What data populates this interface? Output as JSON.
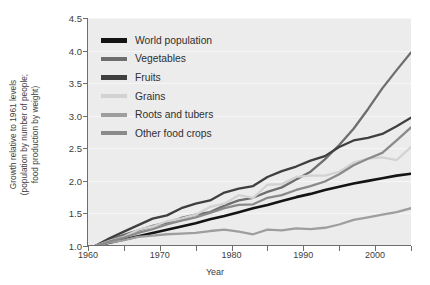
{
  "chart_data": {
    "type": "line",
    "title": "",
    "xlabel": "Year",
    "ylabel": "Growth relative to 1961 levels (population by number of people; food production by weight)",
    "ylabel_line1": "Growth relative to 1961 levels",
    "ylabel_line2": "(population by number of people;",
    "ylabel_line3": "food production by weight)",
    "xlim": [
      1960,
      2005
    ],
    "ylim": [
      1.0,
      4.5
    ],
    "grid": true,
    "legend_position": "top-left inside plot",
    "xticks": [
      1960,
      1965,
      1970,
      1975,
      1980,
      1985,
      1990,
      1995,
      2000,
      2005
    ],
    "xtick_labels": [
      "1960",
      "",
      "1970",
      "",
      "1980",
      "",
      "1990",
      "",
      "2000",
      ""
    ],
    "yticks": [
      1.0,
      1.5,
      2.0,
      2.5,
      3.0,
      3.5,
      4.0,
      4.5
    ],
    "ytick_labels": [
      "1.0",
      "1.5",
      "2.0",
      "2.5",
      "3.0",
      "3.5",
      "4.0",
      "4.5"
    ],
    "x": [
      1961,
      1963,
      1965,
      1967,
      1969,
      1971,
      1973,
      1975,
      1977,
      1979,
      1981,
      1983,
      1985,
      1987,
      1989,
      1991,
      1993,
      1995,
      1997,
      1999,
      2001,
      2003,
      2005
    ],
    "series": [
      {
        "name": "World population",
        "color": "#141414",
        "width": 2.6,
        "values": [
          1.0,
          1.05,
          1.1,
          1.15,
          1.2,
          1.25,
          1.3,
          1.35,
          1.41,
          1.46,
          1.52,
          1.58,
          1.63,
          1.69,
          1.75,
          1.8,
          1.86,
          1.91,
          1.96,
          2.0,
          2.04,
          2.08,
          2.11
        ]
      },
      {
        "name": "Vegetables",
        "color": "#6e6e6e",
        "width": 2.3,
        "values": [
          1.0,
          1.1,
          1.17,
          1.24,
          1.31,
          1.36,
          1.43,
          1.48,
          1.52,
          1.62,
          1.7,
          1.74,
          1.83,
          1.9,
          2.02,
          2.14,
          2.33,
          2.55,
          2.8,
          3.1,
          3.42,
          3.7,
          3.97
        ]
      },
      {
        "name": "Fruits",
        "color": "#3f3f3f",
        "width": 2.3,
        "values": [
          1.0,
          1.12,
          1.22,
          1.32,
          1.42,
          1.47,
          1.58,
          1.65,
          1.7,
          1.82,
          1.88,
          1.92,
          2.06,
          2.15,
          2.22,
          2.31,
          2.38,
          2.52,
          2.62,
          2.66,
          2.72,
          2.84,
          2.97
        ]
      },
      {
        "name": "Grains",
        "color": "#d2d2d2",
        "width": 2.3,
        "values": [
          1.0,
          1.08,
          1.14,
          1.25,
          1.3,
          1.38,
          1.42,
          1.48,
          1.6,
          1.65,
          1.78,
          1.74,
          1.94,
          1.95,
          2.06,
          2.08,
          2.08,
          2.14,
          2.28,
          2.34,
          2.36,
          2.32,
          2.52
        ]
      },
      {
        "name": "Roots and tubers",
        "color": "#9e9e9e",
        "width": 2.3,
        "values": [
          1.0,
          1.05,
          1.09,
          1.14,
          1.16,
          1.18,
          1.19,
          1.2,
          1.23,
          1.25,
          1.22,
          1.18,
          1.25,
          1.24,
          1.27,
          1.26,
          1.28,
          1.33,
          1.4,
          1.44,
          1.48,
          1.52,
          1.58
        ]
      },
      {
        "name": "Other food crops",
        "color": "#8a8a8a",
        "width": 2.3,
        "values": [
          1.0,
          1.07,
          1.13,
          1.2,
          1.26,
          1.33,
          1.39,
          1.44,
          1.51,
          1.58,
          1.63,
          1.64,
          1.74,
          1.78,
          1.86,
          1.92,
          1.99,
          2.1,
          2.24,
          2.34,
          2.43,
          2.62,
          2.82
        ]
      }
    ]
  },
  "legend": {
    "items": [
      {
        "label": "World population",
        "color": "#141414",
        "thickness": 5
      },
      {
        "label": "Vegetables",
        "color": "#6e6e6e",
        "thickness": 4
      },
      {
        "label": "Fruits",
        "color": "#3f3f3f",
        "thickness": 5
      },
      {
        "label": "Grains",
        "color": "#d2d2d2",
        "thickness": 4
      },
      {
        "label": "Roots and tubers",
        "color": "#9e9e9e",
        "thickness": 4
      },
      {
        "label": "Other food crops",
        "color": "#8a8a8a",
        "thickness": 4
      }
    ]
  },
  "colors": {
    "plot_background": "#ececec",
    "page_background": "#ffffff",
    "axis": "#6e6e6e",
    "grid": "#f6f6f6",
    "text": "#3d3d3d"
  }
}
